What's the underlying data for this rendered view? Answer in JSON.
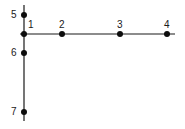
{
  "diagram": {
    "line_color": "#1a1a1a",
    "point_color": "#0d0d0d",
    "horizontal_axis": {
      "x1": 20,
      "y": 34,
      "x2": 175
    },
    "vertical_axis": {
      "x": 24,
      "y1": 5,
      "y2": 121
    },
    "points": [
      {
        "label": "1",
        "cx": 24,
        "cy": 34,
        "lx": 28,
        "ly": 28
      },
      {
        "label": "2",
        "cx": 62,
        "cy": 34,
        "lx": 59,
        "ly": 28
      },
      {
        "label": "3",
        "cx": 120,
        "cy": 34,
        "lx": 117,
        "ly": 28
      },
      {
        "label": "4",
        "cx": 167,
        "cy": 34,
        "lx": 164,
        "ly": 28
      },
      {
        "label": "5",
        "cx": 24,
        "cy": 15,
        "lx": 11,
        "ly": 18
      },
      {
        "label": "6",
        "cx": 24,
        "cy": 53,
        "lx": 11,
        "ly": 56
      },
      {
        "label": "7",
        "cx": 24,
        "cy": 112,
        "lx": 11,
        "ly": 115
      }
    ]
  }
}
